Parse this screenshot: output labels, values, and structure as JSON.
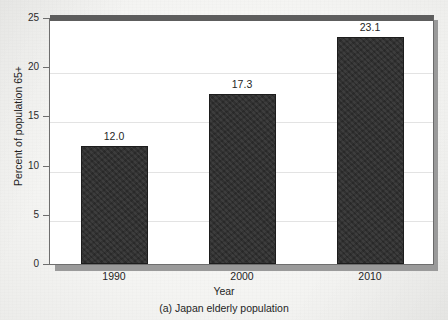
{
  "chart_data": {
    "type": "bar",
    "title": "",
    "caption": "(a) Japan elderly population",
    "xlabel": "Year",
    "ylabel": "Percent of population 65+",
    "categories": [
      "1990",
      "2000",
      "2010"
    ],
    "values": [
      12.0,
      23.1,
      17.3
    ],
    "value_labels": [
      "12.0",
      "17.3",
      "23.1"
    ],
    "series": [
      {
        "name": "Percent of population 65+",
        "values": [
          12.0,
          17.3,
          23.1
        ]
      }
    ],
    "ylim": [
      0,
      25
    ],
    "xlim_categories": 3,
    "y_ticks": [
      0,
      5,
      10,
      15,
      20,
      25
    ],
    "y_tick_labels": [
      "0",
      "5",
      "10",
      "15",
      "20",
      "25"
    ],
    "x_tick_labels": [
      "1990",
      "2000",
      "2010"
    ],
    "grid": "horizontal",
    "legend": "none",
    "bar_color": "#2d2d2d",
    "panel_color": "#ffffff",
    "axis_color": "#6e6e6e",
    "gridline_color": "#e3e3e3",
    "page_color": "#f4f4f2"
  },
  "figure": {
    "caption": "(a) Japan elderly population",
    "x_axis_title": "Year",
    "y_axis_title": "Percent of population 65+"
  },
  "y_ticks": [
    {
      "label": "25",
      "value": 25
    },
    {
      "label": "20",
      "value": 20
    },
    {
      "label": "15",
      "value": 15
    },
    {
      "label": "10",
      "value": 10
    },
    {
      "label": "5",
      "value": 5
    },
    {
      "label": "0",
      "value": 0
    }
  ],
  "bars": [
    {
      "category": "1990",
      "value": 12.0,
      "label": "12.0"
    },
    {
      "category": "2000",
      "value": 17.3,
      "label": "17.3"
    },
    {
      "category": "2010",
      "value": 23.1,
      "label": "23.1"
    }
  ]
}
